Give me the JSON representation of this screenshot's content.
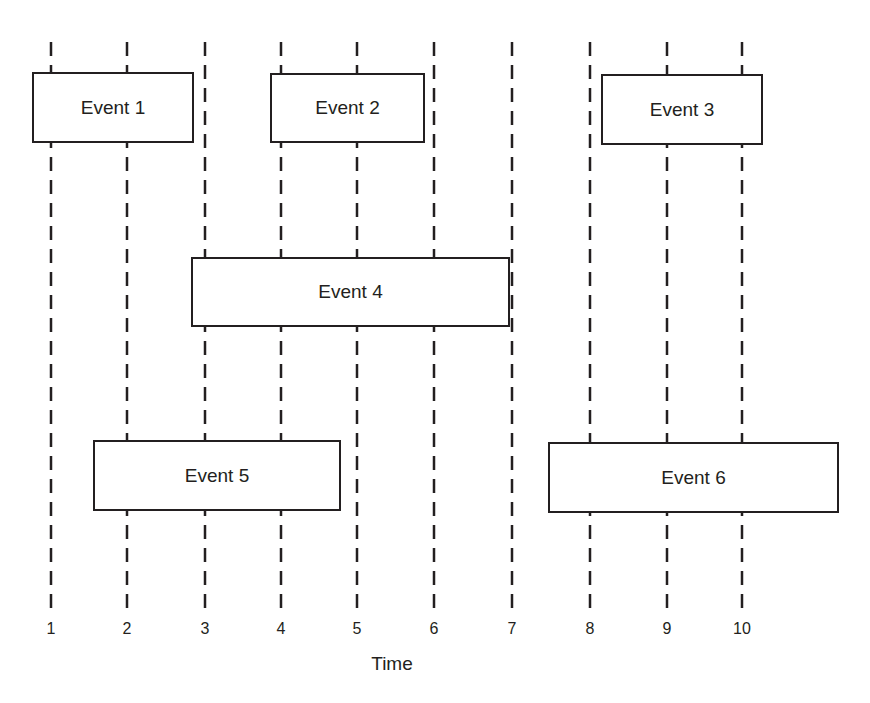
{
  "diagram": {
    "title": "",
    "axis": {
      "label": "Time",
      "ticks": [
        "1",
        "2",
        "3",
        "4",
        "5",
        "6",
        "7",
        "8",
        "9",
        "10"
      ],
      "tick_x": [
        51,
        127,
        205,
        281,
        357,
        434,
        512,
        590,
        667,
        742
      ]
    },
    "line_style": {
      "color": "#231f20",
      "dash": "14 9",
      "width": 2.5,
      "y_start": 42,
      "y_end": 610
    },
    "box_style": {
      "stroke": "#231f20",
      "fill": "#ffffff",
      "stroke_width": 2
    },
    "events": [
      {
        "label": "Event 1",
        "x": 33,
        "y": 73,
        "w": 160,
        "h": 69
      },
      {
        "label": "Event 2",
        "x": 271,
        "y": 74,
        "w": 153,
        "h": 68
      },
      {
        "label": "Event 3",
        "x": 602,
        "y": 75,
        "w": 160,
        "h": 69
      },
      {
        "label": "Event 4",
        "x": 192,
        "y": 258,
        "w": 317,
        "h": 68
      },
      {
        "label": "Event 5",
        "x": 94,
        "y": 441,
        "w": 246,
        "h": 69
      },
      {
        "label": "Event 6",
        "x": 549,
        "y": 443,
        "w": 289,
        "h": 69
      }
    ]
  },
  "chart_data": {
    "type": "timeline",
    "title": "",
    "xlabel": "Time",
    "ylabel": "",
    "x_ticks": [
      1,
      2,
      3,
      4,
      5,
      6,
      7,
      8,
      9,
      10
    ],
    "xlim": [
      1,
      10
    ],
    "grid": "vertical dashed lines at each integer time",
    "events": [
      {
        "name": "Event 1",
        "start": 0.8,
        "end": 2.9,
        "row": 1
      },
      {
        "name": "Event 2",
        "start": 3.9,
        "end": 5.9,
        "row": 1
      },
      {
        "name": "Event 3",
        "start": 8.15,
        "end": 10.25,
        "row": 1
      },
      {
        "name": "Event 4",
        "start": 2.8,
        "end": 6.95,
        "row": 2
      },
      {
        "name": "Event 5",
        "start": 1.55,
        "end": 4.8,
        "row": 3
      },
      {
        "name": "Event 6",
        "start": 7.6,
        "end": 11.4,
        "row": 3
      }
    ]
  }
}
